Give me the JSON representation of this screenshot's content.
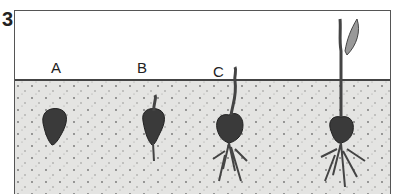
{
  "figure": {
    "number": "3",
    "labels": [
      "A",
      "B",
      "C"
    ],
    "stages": [
      {
        "label": "A",
        "description": "seed in soil"
      },
      {
        "label": "B",
        "description": "seed with emerging root and shoot"
      },
      {
        "label": "C",
        "description": "seedling with roots, shoot breaking surface"
      },
      {
        "label": "",
        "description": "seedling with leaf above ground"
      }
    ],
    "colors": {
      "soil": "#e4e4e2",
      "seed": "#3a3a3a",
      "border": "#555555"
    }
  }
}
